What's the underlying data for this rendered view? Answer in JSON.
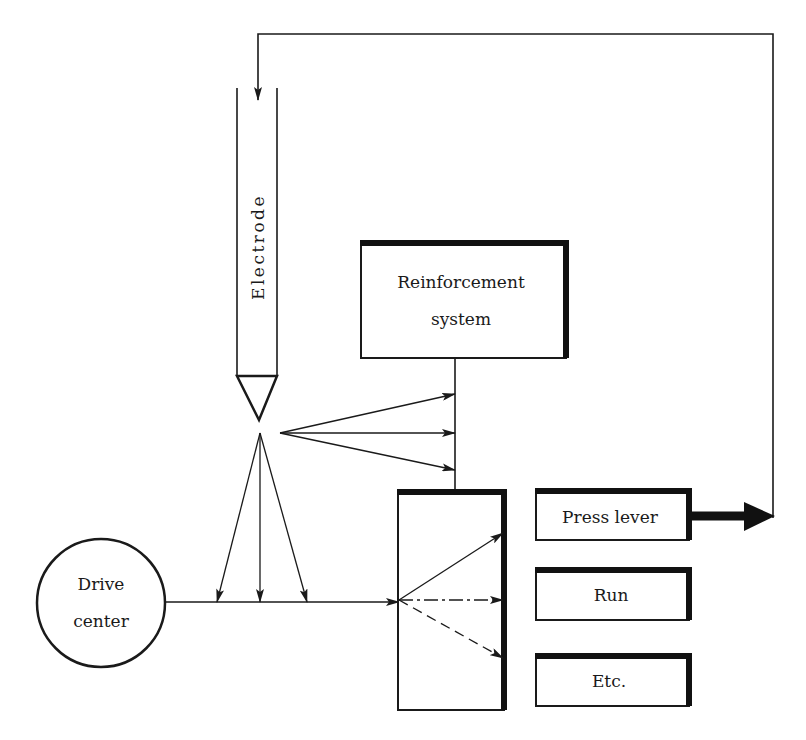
{
  "diagram": {
    "nodes": {
      "electrode": {
        "label": "Electrode"
      },
      "reinforcement": {
        "label_line1": "Reinforcement",
        "label_line2": "system"
      },
      "drive_center": {
        "label_line1": "Drive",
        "label_line2": "center"
      },
      "response_press_lever": {
        "label": "Press lever"
      },
      "response_run": {
        "label": "Run"
      },
      "response_etc": {
        "label": "Etc."
      }
    },
    "edges": [
      {
        "from": "press-lever",
        "to": "electrode",
        "style": "feedback"
      },
      {
        "from": "electrode",
        "to": "reinforcement-line",
        "count": 3
      },
      {
        "from": "electrode",
        "to": "drive-line",
        "count": 3
      },
      {
        "from": "drive-center",
        "to": "selector-box"
      },
      {
        "from": "reinforcement",
        "to": "selector-box"
      },
      {
        "from": "selector-box",
        "to": "press-lever",
        "style": "solid"
      },
      {
        "from": "selector-box",
        "to": "run",
        "style": "dash-dot"
      },
      {
        "from": "selector-box",
        "to": "etc",
        "style": "dashed"
      },
      {
        "from": "press-lever",
        "to": "output",
        "style": "heavy"
      }
    ],
    "colors": {
      "ink": "#1a1a1a",
      "paper": "#ffffff"
    }
  }
}
